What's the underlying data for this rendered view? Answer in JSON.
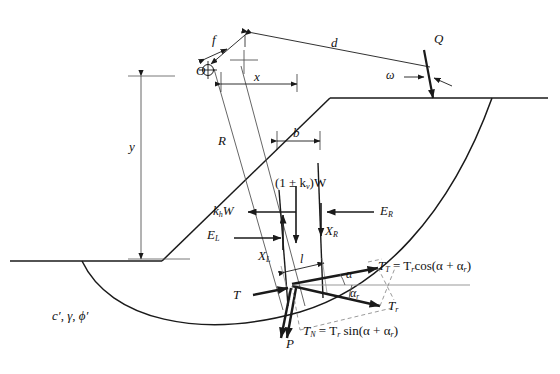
{
  "figure": {
    "type": "engineering-diagram"
  },
  "labels": {
    "center_of_rotation": "O",
    "offset_f": "f",
    "moment_arm_d": "d",
    "horiz_dist_x": "x",
    "vert_dist_y": "y",
    "slice_width_b": "b",
    "radius_R": "R",
    "base_length_l": "l",
    "surcharge_Q": "Q",
    "load_angle_omega": "ω",
    "weight_vertical": "(1 ± k",
    "weight_vertical_sub": "v",
    "weight_vertical_tail": ")W",
    "seismic_horizontal": "k",
    "seismic_horizontal_sub": "h",
    "seismic_horizontal_tail": "W",
    "interslice_EL": "E",
    "interslice_EL_sub": "L",
    "interslice_XL": "X",
    "interslice_XL_sub": "L",
    "interslice_ER": "E",
    "interslice_ER_sub": "R",
    "interslice_XR": "X",
    "interslice_XR_sub": "R",
    "shear_T": "T",
    "normal_P": "P",
    "angle_alpha": "α",
    "angle_alpha_r": "α",
    "angle_alpha_r_sub": "r",
    "reinforcement_Tr": "T",
    "reinforcement_Tr_sub": "r",
    "eq_TT": "T",
    "eq_TT_sub": "T",
    "eq_TT_rhs": " = T",
    "eq_TT_rhs_sub": "r",
    "eq_TT_rhs_tail": "cos(α + α",
    "eq_TT_rhs_tail_sub": "r",
    "eq_TT_close": ")",
    "eq_TN": "T",
    "eq_TN_sub": "N",
    "eq_TN_rhs": " = T",
    "eq_TN_rhs_sub": "r",
    "eq_TN_rhs_tail": " sin(α + α",
    "eq_TN_rhs_tail_sub": "r",
    "eq_TN_close": ")",
    "soil_props_c": "c′",
    "soil_props_sep1": ", ",
    "soil_props_gamma": "γ",
    "soil_props_sep2": ", ",
    "soil_props_phi": "ϕ′"
  },
  "colors": {
    "line": "#1a1a1a",
    "thin": "#555555",
    "dashed": "#777777",
    "background": "#ffffff"
  }
}
